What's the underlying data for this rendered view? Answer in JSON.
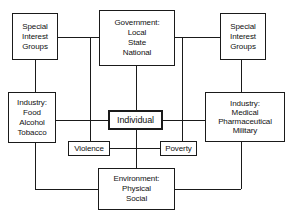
{
  "diagram": {
    "background_color": "#ffffff",
    "line_color": "#1a1a1a",
    "text_color": "#111111",
    "nodes": [
      {
        "id": "special-interest-groups-left",
        "lines": [
          "Special",
          "Interest",
          "Groups"
        ],
        "emphasis": false
      },
      {
        "id": "government",
        "lines": [
          "Government:",
          "Local",
          "State",
          "National"
        ],
        "emphasis": false
      },
      {
        "id": "special-interest-groups-right",
        "lines": [
          "Special",
          "Interest",
          "Groups"
        ],
        "emphasis": false
      },
      {
        "id": "industry-food",
        "lines": [
          "Industry:",
          "Food",
          "Alcohol",
          "Tobacco"
        ],
        "emphasis": false
      },
      {
        "id": "individual",
        "lines": [
          "Individual"
        ],
        "emphasis": true
      },
      {
        "id": "industry-medical",
        "lines": [
          "Industry:",
          "Medical",
          "Pharmaceutical",
          "Military"
        ],
        "emphasis": false
      },
      {
        "id": "violence",
        "lines": [
          "Violence"
        ],
        "emphasis": false
      },
      {
        "id": "poverty",
        "lines": [
          "Poverty"
        ],
        "emphasis": false
      },
      {
        "id": "environment",
        "lines": [
          "Environment:",
          "Physical",
          "Social"
        ],
        "emphasis": false
      }
    ],
    "edges": [
      "special-interest-groups-left -- government",
      "special-interest-groups-left -- industry-food",
      "government -- individual",
      "government -- special-interest-groups-right",
      "special-interest-groups-right -- industry-medical",
      "industry-food -- individual",
      "individual -- industry-medical",
      "individual -- environment",
      "violence -- individual",
      "individual -- poverty",
      "industry-food -- environment",
      "industry-medical -- environment",
      "left-bus -- violence",
      "right-bus -- poverty"
    ]
  }
}
